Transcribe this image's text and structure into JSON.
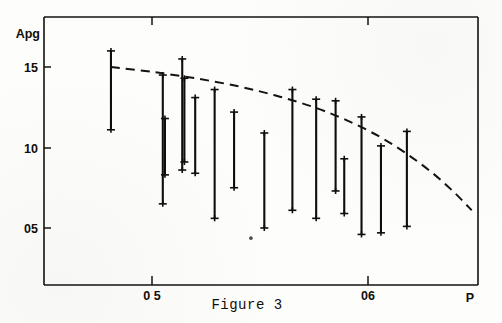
{
  "figure": {
    "caption": "Figure 3",
    "y_axis_title": "Apg",
    "x_axis_title": "P"
  },
  "chart_data": {
    "type": "scatter",
    "subtype": "range-bars-with-fitted-curve",
    "title": "Figure 3",
    "xlabel": "P",
    "ylabel": "Apg",
    "xlim": [
      0.448,
      0.651
    ],
    "ylim": [
      0.3,
      1.73
    ],
    "grid": false,
    "legend": null,
    "xticks": [
      0.5,
      0.6
    ],
    "xticklabels": [
      "0 5",
      "06"
    ],
    "yticks": [
      1.5,
      1.0,
      0.5
    ],
    "yticklabels": [
      "15",
      "10",
      "05"
    ],
    "marker_style": "cross-cap at both ends of vertical bar",
    "series": [
      {
        "name": "measured ranges",
        "type": "vertical-range-bars",
        "points": [
          {
            "x": 0.481,
            "low": 1.11,
            "high": 1.6
          },
          {
            "x": 0.505,
            "low": 0.65,
            "high": 1.45
          },
          {
            "x": 0.506,
            "low": 0.83,
            "high": 1.18
          },
          {
            "x": 0.514,
            "low": 0.86,
            "high": 1.55
          },
          {
            "x": 0.515,
            "low": 0.91,
            "high": 1.43
          },
          {
            "x": 0.52,
            "low": 0.84,
            "high": 1.31
          },
          {
            "x": 0.529,
            "low": 0.56,
            "high": 1.36
          },
          {
            "x": 0.538,
            "low": 0.75,
            "high": 1.22
          },
          {
            "x": 0.552,
            "low": 0.5,
            "high": 1.09
          },
          {
            "x": 0.565,
            "low": 0.61,
            "high": 1.36
          },
          {
            "x": 0.576,
            "low": 0.56,
            "high": 1.3
          },
          {
            "x": 0.585,
            "low": 0.73,
            "high": 1.29
          },
          {
            "x": 0.589,
            "low": 0.59,
            "high": 0.93
          },
          {
            "x": 0.597,
            "low": 0.46,
            "high": 1.19
          },
          {
            "x": 0.606,
            "low": 0.47,
            "high": 1.01
          },
          {
            "x": 0.618,
            "low": 0.51,
            "high": 1.1
          }
        ]
      },
      {
        "name": "fitted trend",
        "type": "dashed-curve",
        "points": [
          {
            "x": 0.481,
            "y": 1.5
          },
          {
            "x": 0.5,
            "y": 1.47
          },
          {
            "x": 0.52,
            "y": 1.43
          },
          {
            "x": 0.54,
            "y": 1.38
          },
          {
            "x": 0.558,
            "y": 1.32
          },
          {
            "x": 0.575,
            "y": 1.25
          },
          {
            "x": 0.59,
            "y": 1.17
          },
          {
            "x": 0.605,
            "y": 1.07
          },
          {
            "x": 0.618,
            "y": 0.96
          },
          {
            "x": 0.63,
            "y": 0.84
          },
          {
            "x": 0.64,
            "y": 0.72
          },
          {
            "x": 0.648,
            "y": 0.61
          }
        ]
      }
    ],
    "annotations": [
      {
        "name": "ink-speck",
        "x": 0.5458,
        "y": 0.437
      }
    ]
  }
}
